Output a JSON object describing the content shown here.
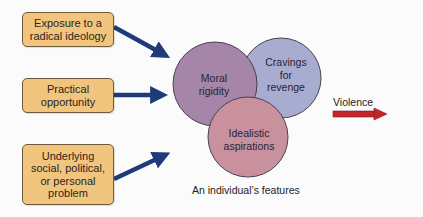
{
  "diagram": {
    "inputs": [
      {
        "label": "Exposure to a radical ideology",
        "lines": [
          "Exposure to a",
          "radical ideology"
        ]
      },
      {
        "label": "Practical opportunity",
        "lines": [
          "Practical",
          "opportunity"
        ]
      },
      {
        "label": "Underlying social, political, or personal problem",
        "lines": [
          "Underlying",
          "social, political,",
          "or personal",
          "problem"
        ]
      }
    ],
    "features": [
      {
        "label": "Moral rigidity",
        "lines": [
          "Moral",
          "rigidity"
        ],
        "color": "#a585a8"
      },
      {
        "label": "Cravings for revenge",
        "lines": [
          "Cravings",
          "for",
          "revenge"
        ],
        "color": "#a8acd0"
      },
      {
        "label": "Idealistic aspirations",
        "lines": [
          "Idealistic",
          "aspirations"
        ],
        "color": "#c9919e"
      }
    ],
    "caption": "An individual’s features",
    "output": "Violence",
    "colors": {
      "box_fill": "#f1c57e",
      "input_arrow": "#1e3a78",
      "output_arrow": "#c0262a"
    }
  }
}
